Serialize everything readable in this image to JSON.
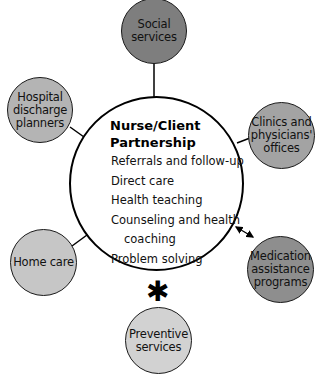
{
  "center": {
    "title": "Nurse/Client\n  Partnership",
    "items": [
      {
        "label": "Referrals and follow-up",
        "indent": false
      },
      {
        "label": "Direct care",
        "indent": false
      },
      {
        "label": "Health teaching",
        "indent": false
      },
      {
        "label": "Counseling and health",
        "indent": false
      },
      {
        "label": "coaching",
        "indent": true
      },
      {
        "label": "Problem solving",
        "indent": false
      }
    ]
  },
  "nodes": {
    "social": {
      "label": "Social\nservices",
      "fill": "#7e7e7e"
    },
    "hospital": {
      "label": "Hospital\ndischarge\nplanners",
      "fill": "#b4b4b4"
    },
    "clinics": {
      "label": "Clinics and\nphysicians'\noffices",
      "fill": "#a3a3a3"
    },
    "medication": {
      "label": "Medication\nassistance\nprograms",
      "fill": "#8e8e8e"
    },
    "home": {
      "label": "Home care",
      "fill": "#c6c6c6"
    },
    "preventive": {
      "label": "Preventive\nservices",
      "fill": "#d2d2d2"
    }
  },
  "annotation": {
    "asterisk": "✱"
  },
  "connectors": {
    "medication_arrow": "bidirectional"
  }
}
